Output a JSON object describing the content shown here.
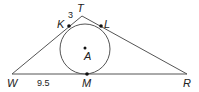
{
  "diagram": {
    "type": "geometry",
    "colors": {
      "stroke": "#555555",
      "text": "#222222",
      "point": "#111111",
      "background": "#ffffff"
    },
    "points": {
      "T": {
        "label": "T",
        "x": 82,
        "y": 16
      },
      "W": {
        "label": "W",
        "x": 12,
        "y": 74
      },
      "R": {
        "label": "R",
        "x": 187,
        "y": 74
      },
      "K": {
        "label": "K",
        "x": 69,
        "y": 26
      },
      "L": {
        "label": "L",
        "x": 101,
        "y": 26
      },
      "M": {
        "label": "M",
        "x": 87,
        "y": 74
      },
      "A": {
        "label": "A",
        "x": 85,
        "y": 48
      }
    },
    "circle": {
      "center": "A",
      "cx": 85,
      "cy": 49,
      "r": 25
    },
    "measurements": {
      "TK": "3",
      "WM": "9.5"
    }
  }
}
